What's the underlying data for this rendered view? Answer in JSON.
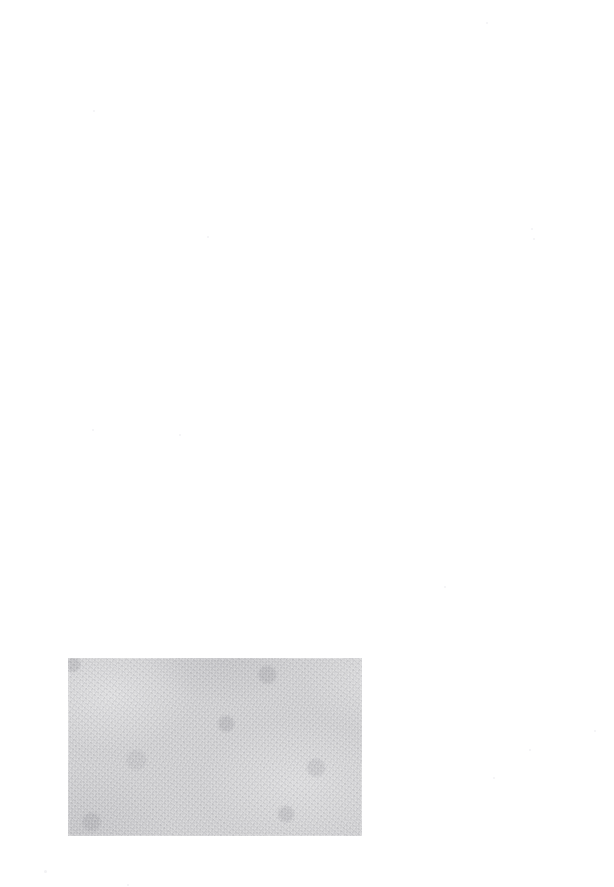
{
  "page": {
    "kind": "scanned-document-page",
    "width": 614,
    "height": 887,
    "background_color": "#ffffff",
    "text_content": "",
    "note": ""
  },
  "image_block": {
    "label": "",
    "caption": "",
    "base_color": "#cdcdcf",
    "x": 68,
    "y": 658,
    "width": 294,
    "height": 178
  },
  "specks": [
    {
      "x": 93,
      "y": 110,
      "size": 2
    },
    {
      "x": 486,
      "y": 22,
      "size": 2
    },
    {
      "x": 92,
      "y": 429,
      "size": 2
    },
    {
      "x": 179,
      "y": 434,
      "size": 2
    },
    {
      "x": 207,
      "y": 236,
      "size": 2
    },
    {
      "x": 533,
      "y": 238,
      "size": 2
    },
    {
      "x": 444,
      "y": 586,
      "size": 2
    },
    {
      "x": 531,
      "y": 228,
      "size": 2
    },
    {
      "x": 44,
      "y": 870,
      "size": 3
    },
    {
      "x": 127,
      "y": 884,
      "size": 2
    },
    {
      "x": 594,
      "y": 730,
      "size": 2
    },
    {
      "x": 529,
      "y": 749,
      "size": 2
    },
    {
      "x": 493,
      "y": 777,
      "size": 2
    }
  ]
}
